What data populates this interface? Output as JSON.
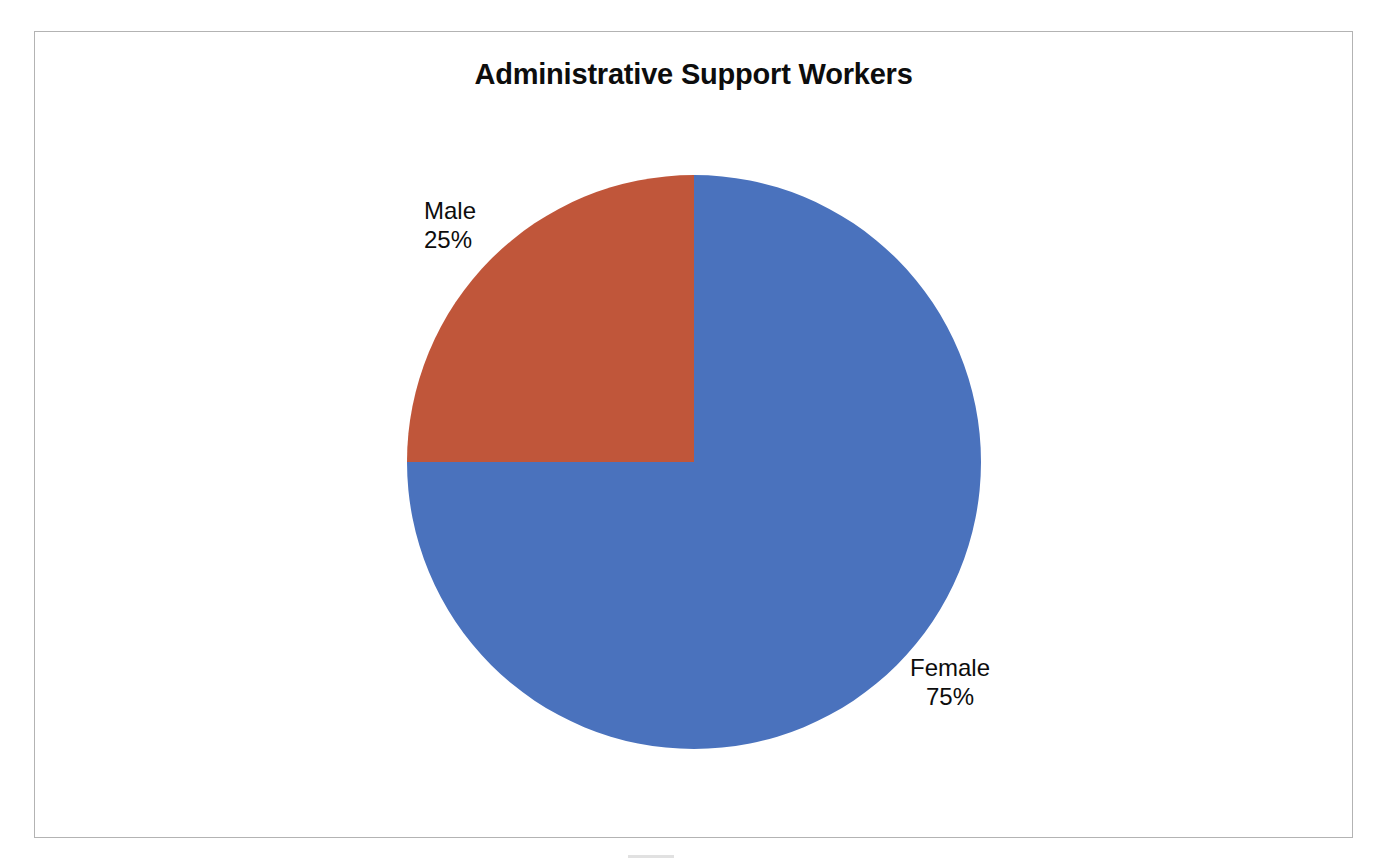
{
  "page": {
    "background_color": "#ffffff",
    "frame_border_color": "#b3b3b3"
  },
  "chart_data": {
    "type": "pie",
    "title": "Administrative Support Workers",
    "subtitle": "",
    "xlabel": "",
    "ylabel": "",
    "categories": [
      "Female",
      "Male"
    ],
    "values": [
      75,
      25
    ],
    "value_unit": "%",
    "slices": [
      {
        "label": "Female",
        "value": 75,
        "value_label": "75%",
        "color": "#4a72bd",
        "start_angle_deg": 0,
        "end_angle_deg": 270,
        "label_position": "outside-right-bottom"
      },
      {
        "label": "Male",
        "value": 25,
        "value_label": "25%",
        "color": "#c0563a",
        "start_angle_deg": 270,
        "end_angle_deg": 360,
        "label_position": "outside-left-top"
      }
    ],
    "legend": false,
    "legend_position": "none",
    "grid": false,
    "data_labels_shown": [
      "category_name",
      "percentage"
    ],
    "start_angle_deg": 0,
    "direction": "clockwise",
    "geometry": {
      "center_x": 694,
      "center_y": 462,
      "radius": 287
    }
  },
  "labels": {
    "male": {
      "name": "Male",
      "value": "25%"
    },
    "female": {
      "name": "Female",
      "value": "75%"
    }
  }
}
